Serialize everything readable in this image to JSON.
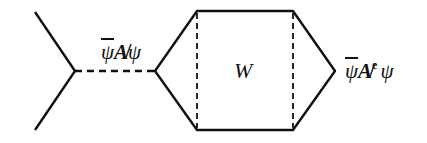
{
  "diagram": {
    "type": "feynman-like-diagram",
    "stroke_color": "#111111",
    "background": "#ffffff",
    "labels": {
      "left_vertex_label": {
        "bar": "ψ",
        "mid": "A̸",
        "tail": "ψ"
      },
      "center_label": "W",
      "right_vertex_label": {
        "bar": "ψ",
        "mid": "A̸",
        "sup": "e",
        "tail": "ψ"
      }
    },
    "edges": [
      {
        "name": "left-upper-leg",
        "style": "solid"
      },
      {
        "name": "left-lower-leg",
        "style": "solid"
      },
      {
        "name": "propagator",
        "style": "dashed"
      },
      {
        "name": "hexagon-outline",
        "style": "solid"
      },
      {
        "name": "inner-left-divider",
        "style": "dashed"
      },
      {
        "name": "inner-right-divider",
        "style": "dashed"
      }
    ]
  }
}
